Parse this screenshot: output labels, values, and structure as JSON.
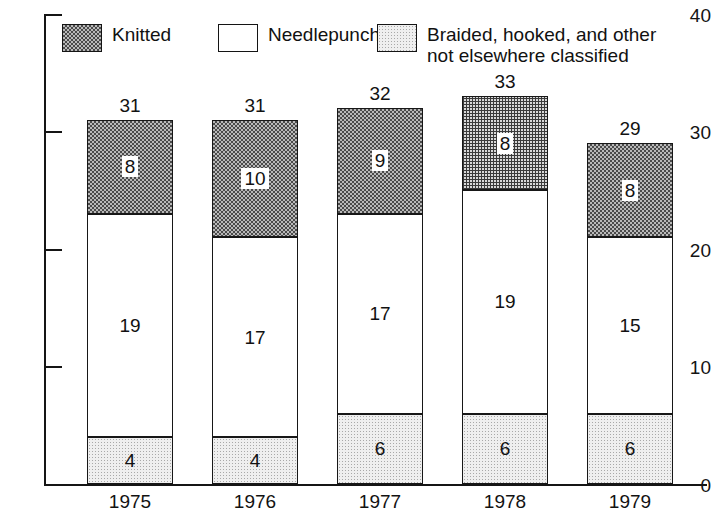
{
  "chart_data": {
    "type": "bar",
    "subtype": "stacked-bar",
    "title": "",
    "subtitle": "",
    "xlabel": "",
    "ylabel": "",
    "categories": [
      "1975",
      "1976",
      "1977",
      "1978",
      "1979"
    ],
    "ylim": [
      0,
      40
    ],
    "yticks": [
      0,
      10,
      20,
      30,
      40
    ],
    "ytick_labels": [
      "0",
      "10",
      "20",
      "30",
      "40"
    ],
    "grid": false,
    "legend_position": "top-inside",
    "stack_order_bottom_to_top": [
      "braided",
      "needlepunch",
      "knitted"
    ],
    "series": [
      {
        "key": "braided",
        "name": "Braided, hooked, and other\nnot elsewhere classified",
        "fill": "light-stipple",
        "color": "#efefef",
        "values": [
          4,
          4,
          6,
          6,
          6
        ]
      },
      {
        "key": "needlepunch",
        "name": "Needlepunch",
        "fill": "white",
        "color": "#ffffff",
        "values": [
          19,
          17,
          17,
          19,
          15
        ]
      },
      {
        "key": "knitted",
        "name": "Knitted",
        "fill": "dark-checker",
        "color": "#7d7d7d",
        "values": [
          8,
          10,
          9,
          8,
          8
        ]
      }
    ],
    "totals": [
      31,
      31,
      32,
      33,
      29
    ],
    "annotations": {
      "bar_total_labels": [
        "31",
        "31",
        "32",
        "33",
        "29"
      ],
      "segment_labels": {
        "knitted": [
          "8",
          "10",
          "9",
          "8",
          "8"
        ],
        "needlepunch": [
          "19",
          "17",
          "17",
          "19",
          "15"
        ],
        "braided": [
          "4",
          "4",
          "6",
          "6",
          "6"
        ]
      }
    }
  },
  "legend": {
    "items": [
      {
        "label": "Knitted",
        "swatch": "dark-checker-swatch"
      },
      {
        "label": "Needlepunch",
        "swatch": "white-swatch"
      },
      {
        "label": "Braided, hooked, and other\nnot elsewhere classified",
        "swatch": "light-stipple-swatch"
      }
    ]
  },
  "axis": {
    "y_labels": [
      "40",
      "30",
      "20",
      "10",
      "0"
    ],
    "x_labels": [
      "1975",
      "1976",
      "1977",
      "1978",
      "1979"
    ]
  },
  "colors": {
    "axis": "#151515",
    "text": "#111111",
    "knitted": "#7d7d7d",
    "needlepunch": "#ffffff",
    "braided": "#efefef"
  }
}
